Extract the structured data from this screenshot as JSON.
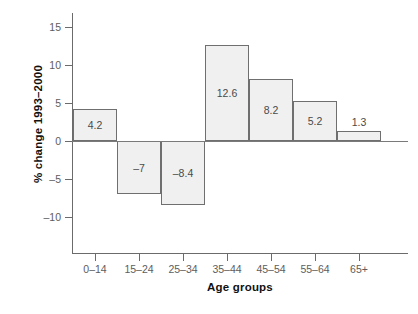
{
  "chart_data": {
    "type": "bar",
    "title": "",
    "xlabel": "Age groups",
    "ylabel": "% change 1993–2000",
    "categories": [
      "0–14",
      "15–24",
      "25–34",
      "35–44",
      "45–54",
      "55–64",
      "65+"
    ],
    "values": [
      4.2,
      -7,
      -8.4,
      12.6,
      8.2,
      5.2,
      1.3
    ],
    "value_labels": [
      "4.2",
      "–7",
      "–8.4",
      "12.6",
      "8.2",
      "5.2",
      "1.3"
    ],
    "ylim": [
      -11.5,
      16.5
    ],
    "yticks": [
      15,
      10,
      5,
      0,
      -5,
      -10
    ],
    "ytick_labels": [
      "15",
      "10",
      "5",
      "0",
      "–5",
      "–10"
    ],
    "grid": false,
    "legend": null,
    "bar_fill": "#f0f0f0",
    "bar_border": "#6f6f6f",
    "axis_color": "#6b6b6b",
    "tick_label_color": "#5d5d5d",
    "axis_title_color": "#111111"
  }
}
